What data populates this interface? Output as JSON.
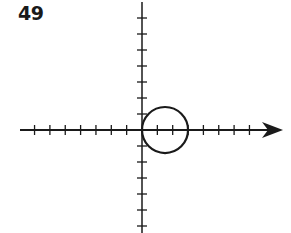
{
  "problem_number": "49",
  "chart_data": {
    "type": "line",
    "title": "",
    "xlabel": "",
    "ylabel": "",
    "curve": "circle",
    "circle": {
      "center": [
        1.5,
        0
      ],
      "radius": 1.5
    },
    "polar_equation_hint": "r = 3cos(theta)",
    "x_ticks": [
      -7,
      -6,
      -5,
      -4,
      -3,
      -2,
      -1,
      1,
      2,
      3,
      4,
      5,
      6,
      7
    ],
    "y_ticks": [
      -7,
      -6,
      -5,
      -4,
      -3,
      -2,
      -1,
      1,
      2,
      3,
      4,
      5,
      6,
      7
    ],
    "xlim": [
      -8,
      9
    ],
    "ylim": [
      -7,
      8
    ],
    "x_axis_arrow": true,
    "grid": false,
    "tick_labels_shown": false
  },
  "colors": {
    "ink": "#1a1a1a",
    "background": "#ffffff"
  }
}
